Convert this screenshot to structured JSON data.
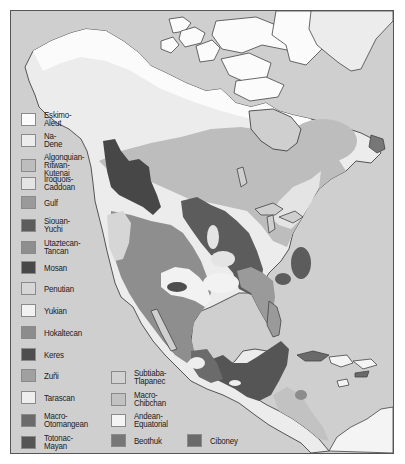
{
  "map": {
    "subject": "Native American language families of North America",
    "colors": {
      "ocean": "#cfcfcf",
      "eskimo_aleut": "#fbfbfb",
      "na_dene": "#ececec",
      "algonquian": "#bdbdbd",
      "iroquois": "#e4e4e4",
      "gulf": "#9a9a9a",
      "siouan": "#5c5c5c",
      "utaztecan": "#8e8e8e",
      "mosan": "#474747",
      "penutian": "#d6d6d6",
      "yukian": "#f2f2f2",
      "hokaltecan": "#8c8c8c",
      "keres": "#4e4e4e",
      "zuni": "#a0a0a0",
      "tarascan": "#eeeeee",
      "macro_otomangean": "#6b6b6b",
      "totonac_mayan": "#555555",
      "subtiaba": "#d2d2d2",
      "macro_chibchan": "#c2c2c2",
      "andean": "#f4f4f4",
      "beothuk": "#777777",
      "ciboney": "#6a6a6a",
      "coast": "#444444"
    }
  },
  "legend": {
    "items": [
      {
        "label": "Eskimo-Aleut",
        "color": "#fbfbfb"
      },
      {
        "label": "Na-Dene",
        "color": "#ececec"
      },
      {
        "label": "Algonquian-\nRitwan-Kutenai",
        "color": "#bdbdbd"
      },
      {
        "label": "Iroquois-Caddoan",
        "color": "#e4e4e4"
      },
      {
        "label": "Gulf",
        "color": "#9a9a9a"
      },
      {
        "label": "Siouan-Yuchi",
        "color": "#5c5c5c"
      },
      {
        "label": "Utaztecan-Tancan",
        "color": "#8e8e8e"
      },
      {
        "label": "Mosan",
        "color": "#474747"
      },
      {
        "label": "Penutian",
        "color": "#d6d6d6"
      },
      {
        "label": "Yukian",
        "color": "#f2f2f2"
      },
      {
        "label": "Hokaltecan",
        "color": "#8c8c8c"
      },
      {
        "label": "Keres",
        "color": "#4e4e4e"
      },
      {
        "label": "Zuñi",
        "color": "#a0a0a0"
      },
      {
        "label": "Tarascan",
        "color": "#eeeeee"
      },
      {
        "label": "Macro-\nOtomangean",
        "color": "#6b6b6b"
      },
      {
        "label": "Totonac-\nMayan",
        "color": "#555555"
      },
      {
        "label": "Subtiaba-\nTlapanec",
        "color": "#d2d2d2"
      },
      {
        "label": "Macro-\nChibchan",
        "color": "#c2c2c2"
      },
      {
        "label": "Andean-\nEquatorial",
        "color": "#f4f4f4"
      },
      {
        "label": "Beothuk",
        "color": "#777777"
      },
      {
        "label": "Ciboney",
        "color": "#6a6a6a"
      }
    ]
  }
}
